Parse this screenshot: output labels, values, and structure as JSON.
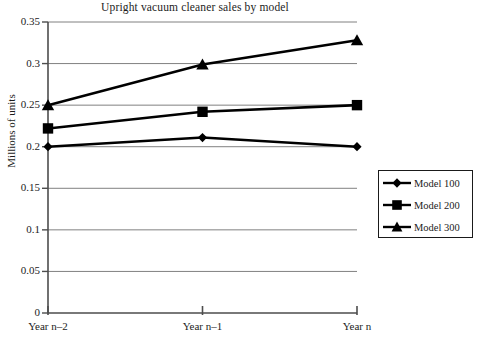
{
  "chart_data": {
    "type": "line",
    "title": "Upright vacuum cleaner sales by model",
    "xlabel": "",
    "ylabel": "Millions of units",
    "categories": [
      "Year n–2",
      "Year n–1",
      "Year n"
    ],
    "ylim": [
      0,
      0.35
    ],
    "yticks": [
      "0",
      "0.05",
      "0.1",
      "0.15",
      "0.2",
      "0.25",
      "0.3",
      "0.35"
    ],
    "ytick_values": [
      0,
      0.05,
      0.1,
      0.15,
      0.2,
      0.25,
      0.3,
      0.35
    ],
    "grid": "horizontal",
    "legend_position": "right",
    "series": [
      {
        "name": "Model 100",
        "marker": "diamond",
        "color": "#000000",
        "values": [
          0.2,
          0.211,
          0.2
        ]
      },
      {
        "name": "Model 200",
        "marker": "square",
        "color": "#000000",
        "values": [
          0.222,
          0.242,
          0.25
        ]
      },
      {
        "name": "Model 300",
        "marker": "triangle",
        "color": "#000000",
        "values": [
          0.25,
          0.299,
          0.328
        ]
      }
    ]
  },
  "legend": {
    "items": [
      {
        "label": "Model 100",
        "marker": "diamond"
      },
      {
        "label": "Model 200",
        "marker": "square"
      },
      {
        "label": "Model 300",
        "marker": "triangle"
      }
    ]
  },
  "axes": {
    "y_title": "Millions of units",
    "y_tick_labels": [
      "0.35",
      "0.3",
      "0.25",
      "0.2",
      "0.15",
      "0.1",
      "0.05",
      "0"
    ],
    "x_tick_labels": [
      "Year n–2",
      "Year n–1",
      "Year n"
    ]
  },
  "colors": {
    "line": "#000000",
    "grid": "#808080",
    "axis": "#4d4d4d",
    "text": "#1c1c1c",
    "background": "#ffffff"
  }
}
